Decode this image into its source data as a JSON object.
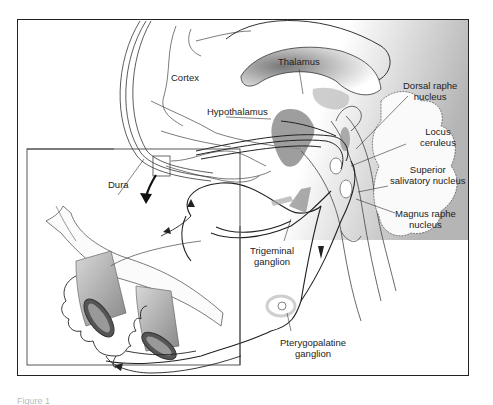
{
  "figure": {
    "caption_partial": "Figure 1"
  },
  "labels": {
    "cortex": "Cortex",
    "thalamus": "Thalamus",
    "hypothalamus": "Hypothalamus",
    "dorsal_raphe_1": "Dorsal raphe",
    "dorsal_raphe_2": "nucleus",
    "locus_1": "Locus",
    "locus_2": "ceruleus",
    "superior_1": "Superior",
    "superior_2": "salivatory nucleus",
    "magnus_1": "Magnus raphe",
    "magnus_2": "nucleus",
    "dura": "Dura",
    "trigeminal_1": "Trigeminal",
    "trigeminal_2": "ganglion",
    "ptery_1": "Pterygopalatine",
    "ptery_2": "ganglion"
  },
  "colors": {
    "line": "#222222",
    "shade": "#8a8a8a",
    "light_shade": "#cfcfcf",
    "gradient_dark": "#9a9a9a"
  }
}
